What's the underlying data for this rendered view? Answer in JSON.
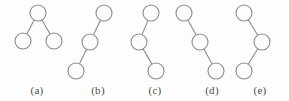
{
  "figure": {
    "width": 289,
    "height": 101,
    "background_color": "#fdfdfd",
    "stroke_color": "#8b8b8b",
    "node_fill_color": "#fdfdfd",
    "caption_color": "#4a4a4a",
    "node_radius": 8
  },
  "trees": [
    {
      "id": "tree-a",
      "label": "(a)",
      "label_x": 37,
      "label_y": 84,
      "shape": "root-with-two-children",
      "nodes": [
        {
          "name": "root",
          "cx": 38,
          "cy": 13
        },
        {
          "name": "left-child",
          "cx": 23,
          "cy": 41
        },
        {
          "name": "right-child",
          "cx": 54,
          "cy": 41
        }
      ],
      "edges": [
        {
          "from": "root",
          "to": "left-child",
          "x1": 38,
          "y1": 13,
          "x2": 23,
          "y2": 41
        },
        {
          "from": "root",
          "to": "right-child",
          "x1": 38,
          "y1": 13,
          "x2": 54,
          "y2": 41
        }
      ]
    },
    {
      "id": "tree-b",
      "label": "(b)",
      "label_x": 98,
      "label_y": 84,
      "shape": "left-leaning-chain",
      "nodes": [
        {
          "name": "top",
          "cx": 104,
          "cy": 13
        },
        {
          "name": "middle",
          "cx": 90,
          "cy": 42
        },
        {
          "name": "bottom",
          "cx": 76,
          "cy": 71
        }
      ],
      "edges": [
        {
          "from": "top",
          "to": "middle",
          "x1": 104,
          "y1": 13,
          "x2": 90,
          "y2": 42
        },
        {
          "from": "middle",
          "to": "bottom",
          "x1": 90,
          "y1": 42,
          "x2": 76,
          "y2": 71
        }
      ]
    },
    {
      "id": "tree-c",
      "label": "(c)",
      "label_x": 155,
      "label_y": 84,
      "shape": "zigzag-left-then-right",
      "nodes": [
        {
          "name": "top",
          "cx": 151,
          "cy": 13
        },
        {
          "name": "middle",
          "cx": 139,
          "cy": 42
        },
        {
          "name": "bottom",
          "cx": 156,
          "cy": 71
        }
      ],
      "edges": [
        {
          "from": "top",
          "to": "middle",
          "x1": 151,
          "y1": 13,
          "x2": 139,
          "y2": 42
        },
        {
          "from": "middle",
          "to": "bottom",
          "x1": 139,
          "y1": 42,
          "x2": 156,
          "y2": 71
        }
      ]
    },
    {
      "id": "tree-d",
      "label": "(d)",
      "label_x": 212,
      "label_y": 84,
      "shape": "right-leaning-chain",
      "nodes": [
        {
          "name": "top",
          "cx": 184,
          "cy": 13
        },
        {
          "name": "middle",
          "cx": 200,
          "cy": 42
        },
        {
          "name": "bottom",
          "cx": 216,
          "cy": 71
        }
      ],
      "edges": [
        {
          "from": "top",
          "to": "middle",
          "x1": 184,
          "y1": 13,
          "x2": 200,
          "y2": 42
        },
        {
          "from": "middle",
          "to": "bottom",
          "x1": 200,
          "y1": 42,
          "x2": 216,
          "y2": 71
        }
      ]
    },
    {
      "id": "tree-e",
      "label": "(e)",
      "label_x": 260,
      "label_y": 84,
      "shape": "zigzag-right-then-left",
      "nodes": [
        {
          "name": "top",
          "cx": 244,
          "cy": 13
        },
        {
          "name": "middle",
          "cx": 262,
          "cy": 42
        },
        {
          "name": "bottom",
          "cx": 244,
          "cy": 71
        }
      ],
      "edges": [
        {
          "from": "top",
          "to": "middle",
          "x1": 244,
          "y1": 13,
          "x2": 262,
          "y2": 42
        },
        {
          "from": "middle",
          "to": "bottom",
          "x1": 262,
          "y1": 42,
          "x2": 244,
          "y2": 71
        }
      ]
    }
  ]
}
